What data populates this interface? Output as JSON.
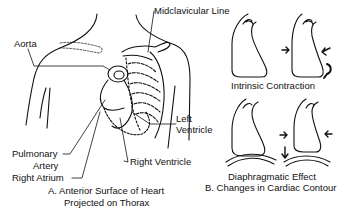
{
  "panel_a": {
    "labels": {
      "aorta": "Aorta",
      "midclavicular_line": "Midclavicular Line",
      "left_ventricle_1": "Left",
      "left_ventricle_2": "Ventricle",
      "pulmonary_artery_1": "Pulmonary",
      "pulmonary_artery_2": "Artery",
      "right_atrium": "Right Atrium",
      "right_ventricle": "Right Ventricle"
    },
    "caption_line1": "A. Anterior Surface of Heart",
    "caption_line2": "Projected on Thorax"
  },
  "panel_b": {
    "labels": {
      "intrinsic_contraction": "Intrinsic Contraction",
      "diaphragmatic_effect": "Diaphragmatic Effect"
    },
    "caption": "B. Changes in Cardiac Contour"
  },
  "colors": {
    "line": "#111111",
    "background": "#ffffff"
  }
}
